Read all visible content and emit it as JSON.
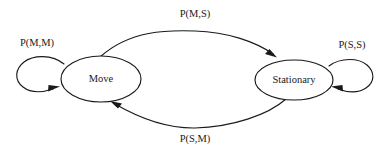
{
  "diagram": {
    "type": "state-transition-diagram",
    "background_color": "#ffffff",
    "stroke_color": "#1a1a1a",
    "text_color": "#1a1a1a",
    "width": 388,
    "height": 155,
    "states": [
      {
        "id": "move",
        "label": "Move",
        "cx": 101,
        "cy": 79,
        "rx": 40,
        "ry": 23
      },
      {
        "id": "stationary",
        "label": "Stationary",
        "cx": 294,
        "cy": 80,
        "rx": 39,
        "ry": 20
      }
    ],
    "transitions": [
      {
        "id": "move-to-move",
        "label": "P(M,M)",
        "from": "move",
        "to": "move",
        "kind": "self-loop",
        "label_x": 37,
        "label_y": 44
      },
      {
        "id": "move-to-stationary",
        "label": "P(M,S)",
        "from": "move",
        "to": "stationary",
        "kind": "arc-top",
        "label_x": 195,
        "label_y": 15
      },
      {
        "id": "stationary-to-move",
        "label": "P(S,M)",
        "from": "stationary",
        "to": "move",
        "kind": "arc-bottom",
        "label_x": 195,
        "label_y": 140
      },
      {
        "id": "stationary-to-stationary",
        "label": "P(S,S)",
        "from": "stationary",
        "to": "stationary",
        "kind": "self-loop",
        "label_x": 352,
        "label_y": 46
      }
    ]
  }
}
